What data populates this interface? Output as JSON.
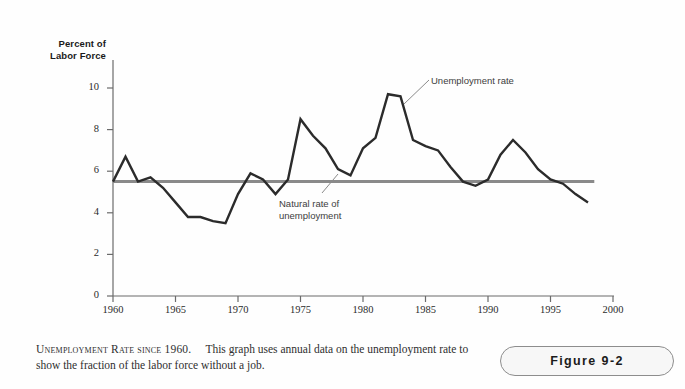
{
  "axis_titles": {
    "y_line1": "Percent of",
    "y_line2": "Labor Force"
  },
  "annotations": {
    "unemployment_rate": "Unemployment rate",
    "natural_rate_line1": "Natural rate of",
    "natural_rate_line2": "unemployment"
  },
  "caption": {
    "heading": "Unemployment Rate since 1960.",
    "body": "This graph uses annual data on the unemployment rate to show the fraction of the labor force without a job."
  },
  "figure_badge": {
    "label": "Figure 9-2"
  },
  "colors": {
    "unemployment_line": "#2b2b2b",
    "natural_rate_line": "#8a8a8a",
    "axis": "#6b6b6b",
    "background": "#fefefe",
    "text": "#2b2b2b"
  },
  "chart_data": {
    "type": "line",
    "title": "Unemployment Rate since 1960",
    "xlabel": "",
    "ylabel": "Percent of Labor Force",
    "xlim": [
      1960,
      2000
    ],
    "ylim": [
      0,
      10
    ],
    "xticks": [
      1960,
      1965,
      1970,
      1975,
      1980,
      1985,
      1990,
      1995,
      2000
    ],
    "yticks": [
      0,
      2,
      4,
      6,
      8,
      10
    ],
    "grid": false,
    "legend": "none",
    "series": [
      {
        "name": "Unemployment rate",
        "x": [
          1960,
          1961,
          1962,
          1963,
          1964,
          1965,
          1966,
          1967,
          1968,
          1969,
          1970,
          1971,
          1972,
          1973,
          1974,
          1975,
          1976,
          1977,
          1978,
          1979,
          1980,
          1981,
          1982,
          1983,
          1984,
          1985,
          1986,
          1987,
          1988,
          1989,
          1990,
          1991,
          1992,
          1993,
          1994,
          1995,
          1996,
          1997,
          1998
        ],
        "values": [
          5.5,
          6.7,
          5.5,
          5.7,
          5.2,
          4.5,
          3.8,
          3.8,
          3.6,
          3.5,
          4.9,
          5.9,
          5.6,
          4.9,
          5.6,
          8.5,
          7.7,
          7.1,
          6.1,
          5.8,
          7.1,
          7.6,
          9.7,
          9.6,
          7.5,
          7.2,
          7.0,
          6.2,
          5.5,
          5.3,
          5.6,
          6.8,
          7.5,
          6.9,
          6.1,
          5.6,
          5.4,
          4.9,
          4.5
        ]
      },
      {
        "name": "Natural rate of unemployment",
        "x": [
          1960,
          1998.5
        ],
        "values": [
          5.5,
          5.5
        ],
        "style": "horizontal-line",
        "color": "#8a8a8a"
      }
    ]
  }
}
